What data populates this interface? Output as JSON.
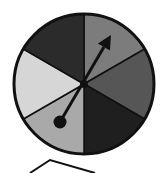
{
  "diagram": {
    "type": "spinner",
    "center": [
      84,
      84
    ],
    "radius": 70,
    "sectors": [
      {
        "name": "sector-1",
        "start_deg": -90,
        "end_deg": -30,
        "color": "#7c7c7c"
      },
      {
        "name": "sector-2",
        "start_deg": -30,
        "end_deg": 30,
        "color": "#565656"
      },
      {
        "name": "sector-3",
        "start_deg": 30,
        "end_deg": 90,
        "color": "#1f1f1f"
      },
      {
        "name": "sector-4",
        "start_deg": 90,
        "end_deg": 150,
        "color": "#a9a9a9"
      },
      {
        "name": "sector-5",
        "start_deg": 150,
        "end_deg": 210,
        "color": "#d6d6d6"
      },
      {
        "name": "sector-6",
        "start_deg": 210,
        "end_deg": 270,
        "color": "#2b2b2b"
      }
    ],
    "arrow": {
      "tail": [
        60,
        122
      ],
      "head": [
        111,
        35
      ]
    },
    "outline_color": "#111111"
  }
}
